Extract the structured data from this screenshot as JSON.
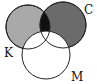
{
  "diagram": {
    "type": "venn",
    "sets": [
      {
        "id": "K",
        "label": "K",
        "cx": 28,
        "cy": 27,
        "r": 22,
        "fill": "#a9a9a9"
      },
      {
        "id": "C",
        "label": "C",
        "cx": 63,
        "cy": 25,
        "r": 23,
        "fill": "#6b6b6b"
      },
      {
        "id": "M",
        "label": "M",
        "cx": 46,
        "cy": 55,
        "r": 24,
        "fill": "#ffffff"
      }
    ],
    "intersection_KC_fill": "#111111",
    "labels": {
      "K": "K",
      "C": "C",
      "M": "M"
    }
  }
}
